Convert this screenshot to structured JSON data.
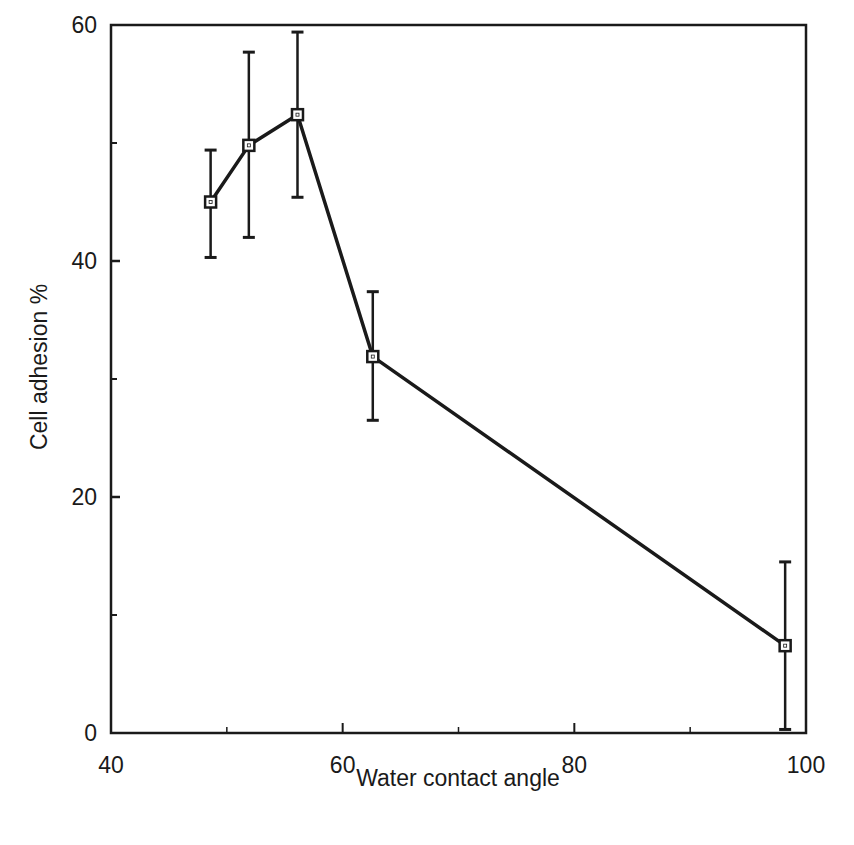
{
  "chart_data": {
    "type": "line",
    "title": "",
    "xlabel": "Water contact angle",
    "ylabel": "Cell adhesion %",
    "xlim": [
      40,
      100
    ],
    "ylim": [
      0,
      60
    ],
    "x_ticks": [
      40,
      60,
      80,
      100
    ],
    "x_minor_ticks": [
      50,
      70,
      90
    ],
    "y_ticks": [
      0,
      20,
      40,
      60
    ],
    "y_minor_ticks": [
      10,
      30,
      50
    ],
    "grid": false,
    "legend": null,
    "marker": "open-square",
    "series": [
      {
        "name": "Cell adhesion",
        "x": [
          48.6,
          51.9,
          56.1,
          62.6,
          98.2
        ],
        "y": [
          45.0,
          49.8,
          52.4,
          31.9,
          7.4
        ],
        "error_upper": [
          49.4,
          57.7,
          59.4,
          37.4,
          14.5
        ],
        "error_lower": [
          40.3,
          42.0,
          45.4,
          26.5,
          0.3
        ]
      }
    ]
  },
  "colors": {
    "ink": "#1a1a1a",
    "background": "#ffffff"
  }
}
